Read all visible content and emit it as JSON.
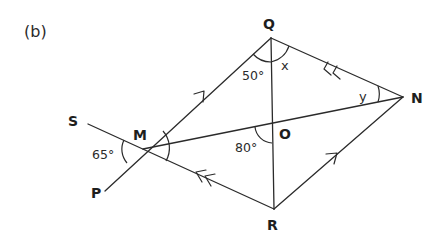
{
  "figure": {
    "part_label": "(b)",
    "points": {
      "S": {
        "label": "S",
        "x": 88,
        "y": 124
      },
      "M": {
        "label": "M",
        "x": 143,
        "y": 149
      },
      "P": {
        "label": "P",
        "x": 105,
        "y": 191
      },
      "Q": {
        "label": "Q",
        "x": 271,
        "y": 38
      },
      "N": {
        "label": "N",
        "x": 403,
        "y": 97
      },
      "R": {
        "label": "R",
        "x": 274,
        "y": 209
      },
      "O": {
        "label": "O",
        "x": 272,
        "y": 124
      }
    },
    "segments": [
      "S-M-R",
      "P-M-Q",
      "M-N",
      "Q-R",
      "Q-N",
      "R-N"
    ],
    "parallel_marks": {
      "single_arrow": [
        "MQ",
        "RN"
      ],
      "double_arrow": [
        "NQ",
        "RM"
      ]
    },
    "angles": {
      "SMP": {
        "label": "65°"
      },
      "MQO": {
        "label": "50°"
      },
      "OQN": {
        "label": "x"
      },
      "QNM": {
        "label": "y"
      },
      "MOR": {
        "label": "80°"
      },
      "QMN": {
        "label": ""
      }
    }
  }
}
